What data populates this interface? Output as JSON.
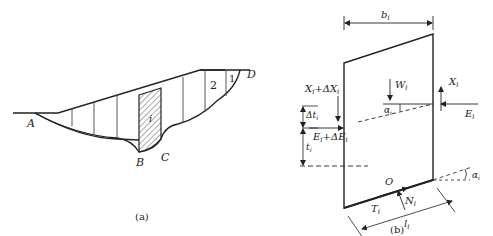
{
  "figure_a": {
    "caption": "(a)",
    "points": {
      "A": "A",
      "B": "B",
      "C": "C",
      "D": "D"
    },
    "slice_labels": {
      "slice_1": "1",
      "slice_2": "2",
      "slice_i": "i"
    }
  },
  "figure_b": {
    "caption": "(b)",
    "labels": {
      "width": "b",
      "width_sub": "i",
      "weight": "W",
      "weight_sub": "i",
      "shear_right": "X",
      "shear_right_sub": "i",
      "normal_right": "E",
      "normal_right_sub": "i",
      "shear_left": "X",
      "shear_left_sub": "i",
      "shear_left_delta": "+ΔX",
      "normal_left": "E",
      "normal_left_sub": "i",
      "normal_left_delta": "+ΔE",
      "delta_t": "Δt",
      "delta_t_sub": "i",
      "t": "t",
      "t_sub": "i",
      "alpha_inner": "α",
      "alpha_inner_sub": "i",
      "alpha_base": "α",
      "alpha_base_sub": "i",
      "origin": "O",
      "shear_base": "T",
      "shear_base_sub": "i",
      "normal_base": "N",
      "normal_base_sub": "i",
      "base_length": "l",
      "base_length_sub": "i"
    }
  }
}
